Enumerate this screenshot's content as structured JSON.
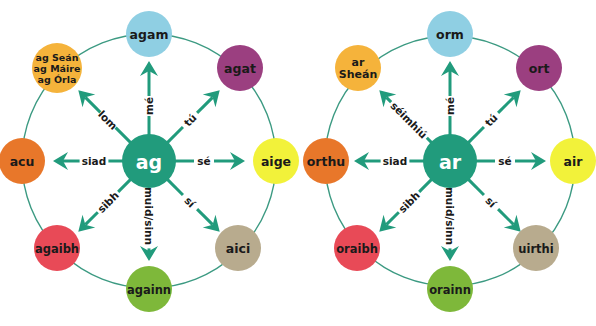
{
  "colors": {
    "teal": "#219b7c",
    "ring": "#3c9a82",
    "blue": "#8fcfe3",
    "purple": "#9b3f80",
    "yellow": "#f2f23a",
    "orange": "#e8772a",
    "gold": "#f5b33b",
    "red": "#e84a57",
    "green": "#7eb83a",
    "tan": "#b8ab8e",
    "text": "#1a1a1a"
  },
  "diagrams": [
    {
      "name": "ag",
      "center": {
        "label": "ag",
        "x": 149,
        "y": 161
      },
      "ring": {
        "cx": 149,
        "cy": 161,
        "r": 127
      },
      "nodes": [
        {
          "id": "top",
          "label": [
            "agam"
          ],
          "x": 149,
          "y": 34,
          "color": "blue"
        },
        {
          "id": "top-right",
          "label": [
            "agat"
          ],
          "x": 240,
          "y": 68,
          "color": "purple"
        },
        {
          "id": "right",
          "label": [
            "aige"
          ],
          "x": 276,
          "y": 161,
          "color": "yellow"
        },
        {
          "id": "bottom-right",
          "label": [
            "aici"
          ],
          "x": 238,
          "y": 248,
          "color": "tan"
        },
        {
          "id": "bottom",
          "label": [
            "againn"
          ],
          "x": 149,
          "y": 289,
          "color": "green"
        },
        {
          "id": "bottom-left",
          "label": [
            "agaibh"
          ],
          "x": 57,
          "y": 248,
          "color": "red"
        },
        {
          "id": "left",
          "label": [
            "acu"
          ],
          "x": 22,
          "y": 161,
          "color": "orange"
        },
        {
          "id": "top-left",
          "label": [
            "ag Seán",
            "ag Máire",
            "ag Órla"
          ],
          "x": 57,
          "y": 68,
          "color": "gold"
        }
      ],
      "arrows": [
        {
          "label": "mé",
          "angle": -90
        },
        {
          "label": "tú",
          "angle": -45
        },
        {
          "label": "sé",
          "angle": 0
        },
        {
          "label": "sí",
          "angle": 45
        },
        {
          "label": "muid/sinn",
          "angle": 90
        },
        {
          "label": "sibh",
          "angle": 135
        },
        {
          "label": "siad",
          "angle": 180
        },
        {
          "label": "lom",
          "angle": 225
        }
      ]
    },
    {
      "name": "ar",
      "center": {
        "label": "ar",
        "x": 450,
        "y": 161
      },
      "ring": {
        "cx": 450,
        "cy": 161,
        "r": 125
      },
      "nodes": [
        {
          "id": "top",
          "label": [
            "orm"
          ],
          "x": 450,
          "y": 34,
          "color": "blue"
        },
        {
          "id": "top-right",
          "label": [
            "ort"
          ],
          "x": 539,
          "y": 68,
          "color": "purple"
        },
        {
          "id": "right",
          "label": [
            "air"
          ],
          "x": 573,
          "y": 161,
          "color": "yellow"
        },
        {
          "id": "bottom-right",
          "label": [
            "uirthi"
          ],
          "x": 536,
          "y": 248,
          "color": "tan"
        },
        {
          "id": "bottom",
          "label": [
            "orainn"
          ],
          "x": 450,
          "y": 289,
          "color": "green"
        },
        {
          "id": "bottom-left",
          "label": [
            "oraibh"
          ],
          "x": 357,
          "y": 248,
          "color": "red"
        },
        {
          "id": "left",
          "label": [
            "orthu"
          ],
          "x": 326,
          "y": 161,
          "color": "orange"
        },
        {
          "id": "top-left",
          "label": [
            "ar",
            "Sheán"
          ],
          "x": 358,
          "y": 68,
          "color": "gold"
        }
      ],
      "arrows": [
        {
          "label": "mé",
          "angle": -90
        },
        {
          "label": "tú",
          "angle": -45
        },
        {
          "label": "sé",
          "angle": 0
        },
        {
          "label": "sí",
          "angle": 45
        },
        {
          "label": "muid/sinn",
          "angle": 90
        },
        {
          "label": "sibh",
          "angle": 135
        },
        {
          "label": "siad",
          "angle": 180
        },
        {
          "label": "séimhiú",
          "angle": 225
        }
      ]
    }
  ]
}
